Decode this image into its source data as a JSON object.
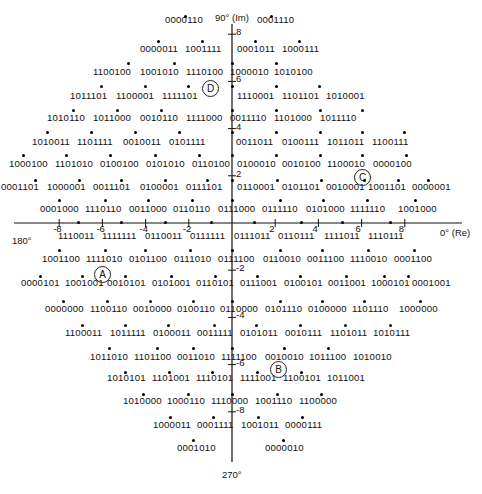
{
  "diagram": {
    "type": "constellation",
    "axes": {
      "top_label": "90° (Im)",
      "right_label": "0° (Re)",
      "left_label": "180°",
      "bottom_label": "270°",
      "x_ticks": [
        "-8",
        "-6",
        "-4",
        "-2",
        "2",
        "4",
        "6",
        "8"
      ],
      "y_ticks": [
        "8",
        "6",
        "4",
        "2",
        "-2",
        "-4",
        "-6",
        "-8"
      ]
    },
    "markers": [
      {
        "label": "D",
        "x": 210,
        "y": 88
      },
      {
        "label": "C",
        "x": 362,
        "y": 177
      },
      {
        "label": "A",
        "x": 102,
        "y": 274
      },
      {
        "label": "B",
        "x": 278,
        "y": 369
      }
    ],
    "rows": [
      {
        "y": 20,
        "labels": [
          {
            "x": 165,
            "t": "0000110"
          },
          {
            "x": 257,
            "t": "0001110"
          }
        ]
      },
      {
        "y": 49,
        "labels": [
          {
            "x": 140,
            "t": "0000011"
          },
          {
            "x": 185,
            "t": "1001111"
          },
          {
            "x": 237,
            "t": "0001011"
          },
          {
            "x": 282,
            "t": "1000111"
          }
        ]
      },
      {
        "y": 72,
        "labels": [
          {
            "x": 93,
            "t": "1100100"
          },
          {
            "x": 140,
            "t": "1001010"
          },
          {
            "x": 186,
            "t": "1110100"
          },
          {
            "x": 230,
            "t": "1000010"
          },
          {
            "x": 274,
            "t": "1010100"
          }
        ]
      },
      {
        "y": 96,
        "labels": [
          {
            "x": 70,
            "t": "1011101"
          },
          {
            "x": 116,
            "t": "1100001"
          },
          {
            "x": 162,
            "t": "1111101"
          },
          {
            "x": 237,
            "t": "1110001"
          },
          {
            "x": 282,
            "t": "1101101"
          },
          {
            "x": 326,
            "t": "1010001"
          }
        ]
      },
      {
        "y": 118,
        "labels": [
          {
            "x": 47,
            "t": "1010110"
          },
          {
            "x": 93,
            "t": "1011000"
          },
          {
            "x": 140,
            "t": "0010110"
          },
          {
            "x": 186,
            "t": "1111000"
          },
          {
            "x": 230,
            "t": "0011110"
          },
          {
            "x": 274,
            "t": "1101000"
          },
          {
            "x": 320,
            "t": "1011110"
          }
        ]
      },
      {
        "y": 142,
        "labels": [
          {
            "x": 32,
            "t": "1010011"
          },
          {
            "x": 77,
            "t": "1101111"
          },
          {
            "x": 123,
            "t": "0010011"
          },
          {
            "x": 169,
            "t": "0101111"
          },
          {
            "x": 236,
            "t": "0011011"
          },
          {
            "x": 282,
            "t": "0100111"
          },
          {
            "x": 327,
            "t": "1011011"
          },
          {
            "x": 372,
            "t": "1100111"
          }
        ]
      },
      {
        "y": 164,
        "labels": [
          {
            "x": 9,
            "t": "1000100"
          },
          {
            "x": 55,
            "t": "1101010"
          },
          {
            "x": 100,
            "t": "0100100"
          },
          {
            "x": 146,
            "t": "0101010"
          },
          {
            "x": 192,
            "t": "0110100"
          },
          {
            "x": 237,
            "t": "0100010"
          },
          {
            "x": 282,
            "t": "0010100"
          },
          {
            "x": 327,
            "t": "1100010"
          },
          {
            "x": 373,
            "t": "0000100"
          }
        ]
      },
      {
        "y": 187,
        "labels": [
          {
            "x": 1,
            "t": "0001101"
          },
          {
            "x": 47,
            "t": "1000001"
          },
          {
            "x": 93,
            "t": "0011101"
          },
          {
            "x": 140,
            "t": "0100001"
          },
          {
            "x": 186,
            "t": "0111101"
          },
          {
            "x": 237,
            "t": "0110001"
          },
          {
            "x": 282,
            "t": "0101101"
          },
          {
            "x": 326,
            "t": "0010001"
          },
          {
            "x": 368,
            "t": "1001101"
          },
          {
            "x": 412,
            "t": "0000001"
          }
        ]
      },
      {
        "y": 209,
        "labels": [
          {
            "x": 40,
            "t": "0001000"
          },
          {
            "x": 85,
            "t": "1110110"
          },
          {
            "x": 129,
            "t": "0011000"
          },
          {
            "x": 173,
            "t": "0110110"
          },
          {
            "x": 218,
            "t": "0111000"
          },
          {
            "x": 262,
            "t": "0111110"
          },
          {
            "x": 306,
            "t": "0101000"
          },
          {
            "x": 350,
            "t": "1111110"
          },
          {
            "x": 398,
            "t": "1001000"
          }
        ]
      },
      {
        "y": 236,
        "labels": [
          {
            "x": 58,
            "t": "1110011"
          },
          {
            "x": 102,
            "t": "1111111"
          },
          {
            "x": 145,
            "t": "0110011"
          },
          {
            "x": 190,
            "t": "0111111"
          },
          {
            "x": 234,
            "t": "0111011"
          },
          {
            "x": 278,
            "t": "0110111"
          },
          {
            "x": 324,
            "t": "1111011"
          },
          {
            "x": 368,
            "t": "1110111"
          }
        ]
      },
      {
        "y": 259,
        "labels": [
          {
            "x": 42,
            "t": "1001100"
          },
          {
            "x": 86,
            "t": "1111010"
          },
          {
            "x": 129,
            "t": "0101100"
          },
          {
            "x": 174,
            "t": "0111010"
          },
          {
            "x": 218,
            "t": "0111100"
          },
          {
            "x": 263,
            "t": "0110010"
          },
          {
            "x": 307,
            "t": "0011100"
          },
          {
            "x": 350,
            "t": "1110010"
          },
          {
            "x": 394,
            "t": "0001100"
          }
        ]
      },
      {
        "y": 283,
        "labels": [
          {
            "x": 21,
            "t": "0000101"
          },
          {
            "x": 65,
            "t": "1001001"
          },
          {
            "x": 107,
            "t": "0010101"
          },
          {
            "x": 152,
            "t": "0101001"
          },
          {
            "x": 196,
            "t": "0110101"
          },
          {
            "x": 240,
            "t": "0111001"
          },
          {
            "x": 284,
            "t": "0100101"
          },
          {
            "x": 328,
            "t": "0011001"
          },
          {
            "x": 371,
            "t": "1000101"
          },
          {
            "x": 412,
            "t": "0001001"
          }
        ]
      },
      {
        "y": 309,
        "labels": [
          {
            "x": 45,
            "t": "0000000"
          },
          {
            "x": 90,
            "t": "1100110"
          },
          {
            "x": 133,
            "t": "0010000"
          },
          {
            "x": 177,
            "t": "0100110"
          },
          {
            "x": 220,
            "t": "0110000"
          },
          {
            "x": 265,
            "t": "0101110"
          },
          {
            "x": 308,
            "t": "0100000"
          },
          {
            "x": 352,
            "t": "1101110"
          },
          {
            "x": 399,
            "t": "1000000"
          }
        ]
      },
      {
        "y": 333,
        "labels": [
          {
            "x": 65,
            "t": "1100011"
          },
          {
            "x": 110,
            "t": "1011111"
          },
          {
            "x": 153,
            "t": "0100011"
          },
          {
            "x": 197,
            "t": "0011111"
          },
          {
            "x": 240,
            "t": "0101011"
          },
          {
            "x": 285,
            "t": "0010111"
          },
          {
            "x": 330,
            "t": "1101011"
          },
          {
            "x": 373,
            "t": "1010111"
          }
        ]
      },
      {
        "y": 357,
        "labels": [
          {
            "x": 90,
            "t": "1011010"
          },
          {
            "x": 134,
            "t": "1101100"
          },
          {
            "x": 177,
            "t": "0011010"
          },
          {
            "x": 221,
            "t": "1111100"
          },
          {
            "x": 265,
            "t": "0010010"
          },
          {
            "x": 309,
            "t": "1011100"
          },
          {
            "x": 353,
            "t": "1010010"
          }
        ]
      },
      {
        "y": 378,
        "labels": [
          {
            "x": 107,
            "t": "1010101"
          },
          {
            "x": 152,
            "t": "1101001"
          },
          {
            "x": 196,
            "t": "1110101"
          },
          {
            "x": 240,
            "t": "1111001"
          },
          {
            "x": 283,
            "t": "1100101"
          },
          {
            "x": 327,
            "t": "1011001"
          }
        ]
      },
      {
        "y": 401,
        "labels": [
          {
            "x": 123,
            "t": "1010000"
          },
          {
            "x": 167,
            "t": "1000110"
          },
          {
            "x": 211,
            "t": "1110000"
          },
          {
            "x": 255,
            "t": "1001110"
          },
          {
            "x": 299,
            "t": "1100000"
          }
        ]
      },
      {
        "y": 425,
        "labels": [
          {
            "x": 153,
            "t": "1000011"
          },
          {
            "x": 197,
            "t": "0001111"
          },
          {
            "x": 241,
            "t": "1001011"
          },
          {
            "x": 285,
            "t": "0000111"
          }
        ]
      },
      {
        "y": 448,
        "labels": [
          {
            "x": 177,
            "t": "0001010"
          },
          {
            "x": 265,
            "t": "0000010"
          }
        ]
      }
    ],
    "dot_rows": [
      {
        "y": 16,
        "xs": [
          185,
          271
        ]
      },
      {
        "y": 41,
        "xs": [
          158,
          202,
          255,
          299
        ]
      },
      {
        "y": 63,
        "xs": [
          128,
          174,
          232,
          276
        ]
      },
      {
        "y": 86,
        "xs": [
          101,
          145,
          188,
          232,
          276,
          319
        ]
      },
      {
        "y": 110,
        "xs": [
          73,
          117,
          161,
          232,
          276,
          320,
          362
        ]
      },
      {
        "y": 132,
        "xs": [
          47,
          91,
          135,
          179,
          232,
          276,
          320,
          362,
          404
        ]
      },
      {
        "y": 155,
        "xs": [
          23,
          66,
          110,
          155,
          199,
          232,
          276,
          320,
          362,
          406
        ]
      },
      {
        "y": 180,
        "xs": [
          35,
          79,
          121,
          165,
          207,
          232,
          277,
          321,
          364,
          398,
          428
        ]
      },
      {
        "y": 200,
        "xs": [
          59,
          105,
          148,
          192,
          232,
          280,
          323,
          367,
          415
        ]
      },
      {
        "y": 222,
        "xs": [
          78,
          121,
          165,
          211,
          254,
          301,
          342,
          390
        ]
      },
      {
        "y": 250,
        "xs": [
          59,
          105,
          145,
          190,
          232,
          280,
          322,
          368,
          414
        ]
      },
      {
        "y": 276,
        "xs": [
          40,
          82,
          125,
          171,
          215,
          257,
          300,
          346,
          384,
          408
        ]
      },
      {
        "y": 301,
        "xs": [
          63,
          107,
          150,
          193,
          232,
          280,
          322,
          364,
          420
        ]
      },
      {
        "y": 325,
        "xs": [
          82,
          125,
          168,
          214,
          256,
          300,
          345,
          390
        ]
      },
      {
        "y": 348,
        "xs": [
          109,
          157,
          193,
          232,
          284,
          328
        ]
      },
      {
        "y": 372,
        "xs": [
          125,
          169,
          212,
          257,
          301
        ]
      },
      {
        "y": 394,
        "xs": [
          143,
          188,
          232,
          277,
          321
        ]
      },
      {
        "y": 417,
        "xs": [
          170,
          213,
          258,
          302
        ]
      },
      {
        "y": 440,
        "xs": [
          193,
          283
        ]
      }
    ]
  }
}
